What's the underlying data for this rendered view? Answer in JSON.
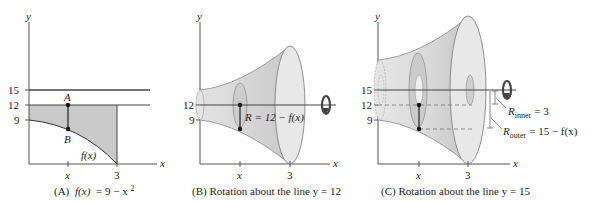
{
  "figure": {
    "panels": [
      {
        "id": "A",
        "caption_prefix": "(A)",
        "caption_fx": "f(x)",
        "caption_eq": "= 9 − x",
        "caption_exp": "2",
        "y_axis_label": "y",
        "x_axis_label": "x",
        "y_ticks": [
          "15",
          "12",
          "9"
        ],
        "x_ticks": [
          "x",
          "3"
        ],
        "point_a": "A",
        "point_b": "B",
        "curve_label": "f(x)"
      },
      {
        "id": "B",
        "caption": "(B) Rotation about the line y = 12",
        "y_axis_label": "y",
        "x_axis_label": "x",
        "y_ticks": [
          "12",
          "9"
        ],
        "x_ticks": [
          "x",
          "3"
        ],
        "radius_label": "R = 12 − f(x)",
        "rotation_icon": "rotation-arrow-icon"
      },
      {
        "id": "C",
        "caption": "(C) Rotation about the line y = 15",
        "y_axis_label": "y",
        "x_axis_label": "x",
        "y_ticks": [
          "15",
          "12",
          "9"
        ],
        "x_ticks": [
          "x",
          "3"
        ],
        "r_inner_main": "R",
        "r_inner_sub": "inner",
        "r_inner_val": "= 3",
        "r_outer_main": "R",
        "r_outer_sub": "outer",
        "r_outer_val": "= 15 − f(x)",
        "rotation_icon": "rotation-arrow-icon"
      }
    ],
    "colors": {
      "shade": "#c9c9c9",
      "solid_light": "#e6e6e6",
      "solid_mid": "#d2d2d2",
      "solid_dark": "#bdbdbd",
      "line": "#333333",
      "axis": "#555555"
    }
  }
}
